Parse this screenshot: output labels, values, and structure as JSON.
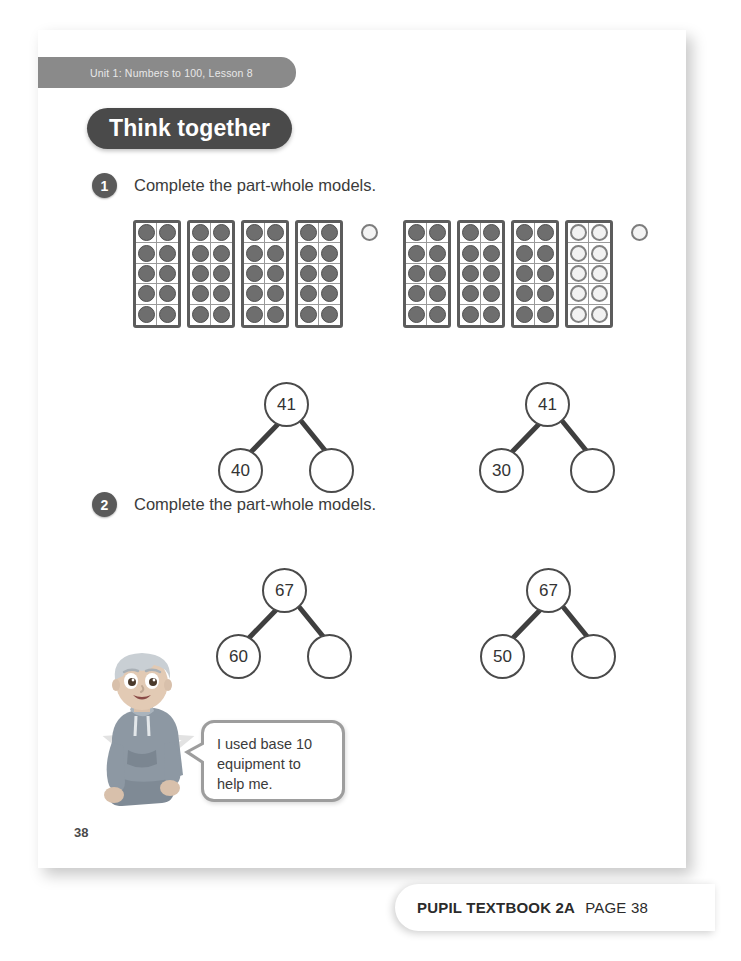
{
  "page": {
    "unit_tab_label": "Unit 1: Numbers to 100, Lesson 8",
    "banner_label": "Think together",
    "page_number": "38"
  },
  "footer": {
    "book_label": "PUPIL TEXTBOOK 2A",
    "page_label": "PAGE 38"
  },
  "questions": [
    {
      "number": "1",
      "text": "Complete the part-whole models."
    },
    {
      "number": "2",
      "text": "Complete the part-whole models."
    }
  ],
  "base_ten_groups": [
    {
      "name": "group-a",
      "total": 41,
      "frames": [
        {
          "filled": 10
        },
        {
          "filled": 10
        },
        {
          "filled": 10
        },
        {
          "filled": 10
        }
      ],
      "single_counter": "empty"
    },
    {
      "name": "group-b",
      "total": 41,
      "frames": [
        {
          "filled": 10
        },
        {
          "filled": 10
        },
        {
          "filled": 10
        },
        {
          "filled": 0
        }
      ],
      "single_counter": "empty"
    }
  ],
  "part_whole_models": [
    {
      "whole": "41",
      "part_left": "40",
      "part_right": ""
    },
    {
      "whole": "41",
      "part_left": "30",
      "part_right": ""
    },
    {
      "whole": "67",
      "part_left": "60",
      "part_right": ""
    },
    {
      "whole": "67",
      "part_left": "50",
      "part_right": ""
    }
  ],
  "speech": {
    "line1": "I used base 10",
    "line2": "equipment to",
    "line3": "help me."
  },
  "colors": {
    "banner_bg": "#4a4a4a",
    "unit_tab_bg": "#8a8a8a",
    "counter_fill": "#6e6e6e",
    "node_stroke": "#4a4a4a",
    "text": "#3b3b3b"
  }
}
